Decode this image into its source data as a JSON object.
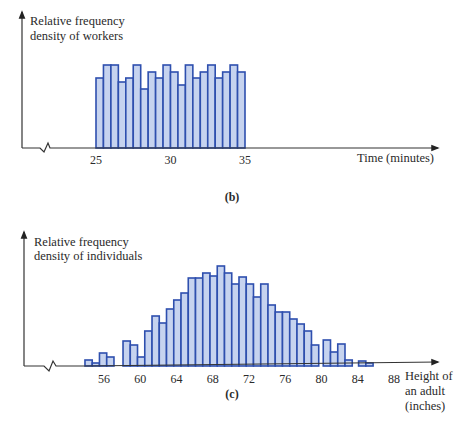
{
  "chart_data": [
    {
      "type": "bar",
      "panel_label": "(b)",
      "title": "",
      "ylabel": "Relative frequency density of workers",
      "ylabel_lines": [
        "Relative frequency",
        "density of workers"
      ],
      "xlabel": "Time (minutes)",
      "x_ticks": [
        25,
        30,
        35
      ],
      "bin_width": 0.5,
      "x_range": [
        25,
        35
      ],
      "grid": false,
      "axis_break": true,
      "bins": [
        {
          "left": 25.0,
          "value": 70
        },
        {
          "left": 25.5,
          "value": 83
        },
        {
          "left": 26.0,
          "value": 83
        },
        {
          "left": 26.5,
          "value": 66
        },
        {
          "left": 27.0,
          "value": 70
        },
        {
          "left": 27.5,
          "value": 83
        },
        {
          "left": 28.0,
          "value": 59
        },
        {
          "left": 28.5,
          "value": 76
        },
        {
          "left": 29.0,
          "value": 70
        },
        {
          "left": 29.5,
          "value": 83
        },
        {
          "left": 30.0,
          "value": 76
        },
        {
          "left": 30.5,
          "value": 63
        },
        {
          "left": 31.0,
          "value": 83
        },
        {
          "left": 31.5,
          "value": 70
        },
        {
          "left": 32.0,
          "value": 76
        },
        {
          "left": 32.5,
          "value": 83
        },
        {
          "left": 33.0,
          "value": 70
        },
        {
          "left": 33.5,
          "value": 76
        },
        {
          "left": 34.0,
          "value": 83
        },
        {
          "left": 34.5,
          "value": 76
        }
      ]
    },
    {
      "type": "bar",
      "panel_label": "(c)",
      "title": "",
      "ylabel": "Relative frequency density of individuals",
      "ylabel_lines": [
        "Relative frequency",
        "density of individuals"
      ],
      "xlabel": "Height of an adult (inches)",
      "xlabel_lines": [
        "Height of",
        "an adult",
        "(inches)"
      ],
      "x_ticks": [
        56,
        60,
        64,
        68,
        72,
        76,
        80,
        84,
        88
      ],
      "bin_width": 0.8,
      "x_range": [
        54,
        86
      ],
      "grid": false,
      "axis_break": true,
      "bins": [
        {
          "left": 53.9,
          "value": 6
        },
        {
          "left": 54.7,
          "value": 3
        },
        {
          "left": 55.5,
          "value": 13
        },
        {
          "left": 56.3,
          "value": 9
        },
        {
          "left": 58.1,
          "value": 25
        },
        {
          "left": 58.9,
          "value": 21
        },
        {
          "left": 59.7,
          "value": 9
        },
        {
          "left": 60.5,
          "value": 35
        },
        {
          "left": 61.3,
          "value": 50
        },
        {
          "left": 62.1,
          "value": 43
        },
        {
          "left": 62.9,
          "value": 57
        },
        {
          "left": 63.7,
          "value": 66
        },
        {
          "left": 64.5,
          "value": 73
        },
        {
          "left": 65.3,
          "value": 88
        },
        {
          "left": 66.1,
          "value": 88
        },
        {
          "left": 66.9,
          "value": 93
        },
        {
          "left": 67.7,
          "value": 90
        },
        {
          "left": 68.5,
          "value": 100
        },
        {
          "left": 69.3,
          "value": 93
        },
        {
          "left": 70.1,
          "value": 82
        },
        {
          "left": 70.9,
          "value": 89
        },
        {
          "left": 71.7,
          "value": 82
        },
        {
          "left": 72.5,
          "value": 69
        },
        {
          "left": 73.3,
          "value": 82
        },
        {
          "left": 74.1,
          "value": 61
        },
        {
          "left": 74.9,
          "value": 54
        },
        {
          "left": 75.7,
          "value": 54
        },
        {
          "left": 76.5,
          "value": 47
        },
        {
          "left": 77.3,
          "value": 42
        },
        {
          "left": 78.1,
          "value": 35
        },
        {
          "left": 78.9,
          "value": 21
        },
        {
          "left": 80.2,
          "value": 26
        },
        {
          "left": 81.0,
          "value": 14
        },
        {
          "left": 81.8,
          "value": 22
        },
        {
          "left": 82.6,
          "value": 6
        },
        {
          "left": 84.1,
          "value": 5
        },
        {
          "left": 84.9,
          "value": 3
        }
      ]
    }
  ]
}
